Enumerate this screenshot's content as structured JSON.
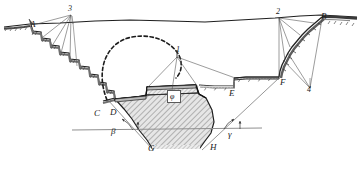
{
  "figure": {
    "name": "valley-cross-section",
    "colors": {
      "line": "#1a1a1a",
      "thin_line": "#5a5a5a",
      "ground_surface": "#2b2b2b",
      "hatch": "#6e6e6e",
      "fill_light": "#d9d9d9",
      "fill_body": "#c9c9c9",
      "rock_shade": "#555555",
      "dashed": "#222222",
      "background": "#ffffff"
    }
  },
  "point_labels": [
    {
      "id": "A",
      "text": "A",
      "x": 30,
      "y": 20
    },
    {
      "id": "B",
      "text": "B",
      "x": 321,
      "y": 12
    },
    {
      "id": "C",
      "text": "C",
      "x": 94,
      "y": 109
    },
    {
      "id": "D",
      "text": "D",
      "x": 110,
      "y": 108
    },
    {
      "id": "E",
      "text": "E",
      "x": 229,
      "y": 89
    },
    {
      "id": "F",
      "text": "F",
      "x": 280,
      "y": 78
    },
    {
      "id": "G",
      "text": "G",
      "x": 148,
      "y": 144
    },
    {
      "id": "H",
      "text": "H",
      "x": 210,
      "y": 143
    }
  ],
  "number_labels": [
    {
      "id": "1",
      "text": "1",
      "x": 176,
      "y": 52
    },
    {
      "id": "2",
      "text": "2",
      "x": 276,
      "y": 11
    },
    {
      "id": "3",
      "text": "3",
      "x": 68,
      "y": 7
    },
    {
      "id": "4",
      "text": "4",
      "x": 307,
      "y": 84
    }
  ],
  "angle_labels": [
    {
      "id": "beta",
      "text": "β",
      "x": 111,
      "y": 129
    },
    {
      "id": "gamma",
      "text": "γ",
      "x": 228,
      "y": 132
    },
    {
      "id": "phi",
      "text": "φ",
      "x": 169,
      "y": 91
    }
  ],
  "geometry": {
    "ground_line": "M4,27 L30,24 L60,23 L95,21 L130,20 L170,21 L205,22 L240,20 L275,18 L300,16 L321,15 L357,17",
    "left_bench_slope": "M31,25 L40,31 L41,37 L49,38 L50,45 L58,46 L59,52 L68,53 L69,59 L78,60 L79,66 L88,67 L89,74 L97,75 L98,82 L105,83 L106,90 L113,91 L114,98 L100,101 L98,103",
    "right_bench_slope": "M321,16 L313,22 L306,28 L300,34 L295,40 L290,46 L286,52 L283,58 L281,64 L279,70 L278,76 L262,77 L246,78 L235,79 L233,86 L214,86 L200,86 L196,84",
    "dam_outline": "M106,100 L113,99 L145,97 L147,88 L196,86 L198,94 L205,97 L212,110 L214,122 L212,132 L207,140 L201,147 L152,148 L147,140 L140,131 L133,120 L126,110 L118,103 L106,100",
    "dashed_arc": "M108,100 C96,72 104,44 130,38 C158,32 178,48 180,62 C181,70 178,74 176,76",
    "river_bed_line": "M72,130 L262,128",
    "crest_line": "M145,95 L147,87 L196,85",
    "dam_core_line": "M113,98 L145,96 L196,94 L199,96"
  },
  "callout_fans": {
    "label_3_lines": [
      "M70,14 L33,25",
      "M70,14 L42,36",
      "M70,14 L51,45",
      "M70,14 L60,52",
      "M70,14 L69,58",
      "M70,14 L72,24"
    ],
    "label_2_lines": [
      "M279,17 L279,76",
      "M279,17 L290,46",
      "M279,17 L299,34",
      "M279,17 L313,22",
      "M279,17 L283,58"
    ],
    "label_4_lines": [
      "M310,90 L282,60",
      "M310,90 L286,52",
      "M310,90 L322,18"
    ],
    "label_1_lines": [
      "M177,56 L147,88",
      "M177,56 L197,86",
      "M177,56 L172,90",
      "M177,56 L238,79"
    ],
    "apex_lines": [
      "M109,100 L152,148",
      "M279,77 L205,144"
    ]
  },
  "annotation_notes": {
    "beta_arc": "angle between river-bed datum and upstream dam slope at G",
    "gamma_arc": "angle between river-bed datum and downstream dam slope at H",
    "phi_box": "internal friction angle symbol inside dam body"
  }
}
